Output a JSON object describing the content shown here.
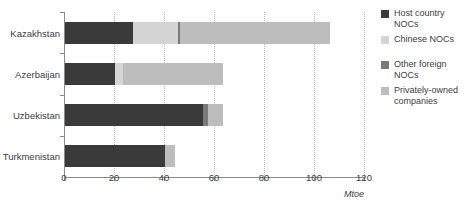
{
  "chart_data": {
    "type": "bar",
    "orientation": "horizontal",
    "stacked": true,
    "title": "",
    "xlabel": "Mtoe",
    "ylabel": "",
    "xlim": [
      0,
      120
    ],
    "xticks": [
      0,
      20,
      40,
      60,
      80,
      100,
      120
    ],
    "xtick_labels": [
      "0",
      "20",
      "40",
      "60",
      "80",
      "100",
      "120"
    ],
    "grid": true,
    "grid_axis": "x",
    "legend_position": "right",
    "categories": [
      "Kazakhstan",
      "Azerbaijan",
      "Uzbekistan",
      "Turkmenistan"
    ],
    "series": [
      {
        "name": "Host country NOCs",
        "color": "#3a3a3a",
        "values": [
          27,
          20,
          55,
          40
        ]
      },
      {
        "name": "Chinese NOCs",
        "color": "#d4d4d4",
        "values": [
          18,
          3,
          0,
          0
        ]
      },
      {
        "name": "Other foreign NOCs",
        "color": "#7a7a7a",
        "values": [
          1,
          0,
          2,
          0
        ]
      },
      {
        "name": "Privately-owned companies",
        "color": "#bdbdbd",
        "values": [
          60,
          40,
          6,
          4
        ]
      }
    ],
    "totals": [
      106,
      63,
      63,
      44
    ],
    "annotations": []
  },
  "legend": {
    "items": [
      {
        "label": "Host country NOCs",
        "color": "#3a3a3a"
      },
      {
        "label": "Chinese NOCs",
        "color": "#d4d4d4"
      },
      {
        "label": "Other foreign NOCs",
        "color": "#7a7a7a"
      },
      {
        "label": "Privately-owned companies",
        "color": "#bdbdbd"
      }
    ]
  },
  "axis": {
    "unit_label": "Mtoe"
  }
}
